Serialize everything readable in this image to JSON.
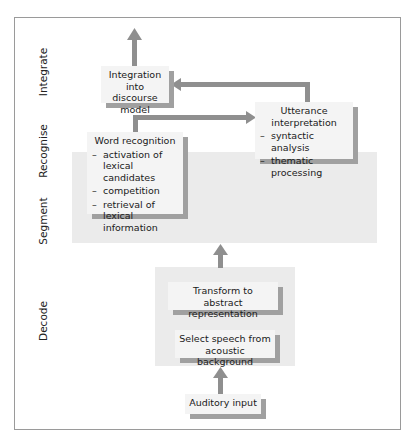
{
  "stages": [
    {
      "id": "integrate",
      "label": "Integrate"
    },
    {
      "id": "recognise",
      "label": "Recognise"
    },
    {
      "id": "segment",
      "label": "Segment"
    },
    {
      "id": "decode",
      "label": "Decode"
    }
  ],
  "boxes": {
    "integration": {
      "title": "Integration into discourse model"
    },
    "utterance": {
      "title": "Utterance interpretation",
      "items": [
        "syntactic analysis",
        "thematic processing"
      ]
    },
    "word_recognition": {
      "title": "Word recognition",
      "items": [
        "activation of lexical candidates",
        "competition",
        "retrieval of lexical information"
      ]
    },
    "transform": {
      "title": "Transform to abstract representation"
    },
    "select_speech": {
      "title": "Select speech from acoustic background"
    },
    "auditory_input": {
      "title": "Auditory input"
    }
  },
  "colors": {
    "arrow": "#8f8f8f",
    "box_fill": "#f4f4f4",
    "box_shadow": "#a0a0a0",
    "band_fill": "#ebebeb",
    "frame": "#9a9a9a"
  }
}
